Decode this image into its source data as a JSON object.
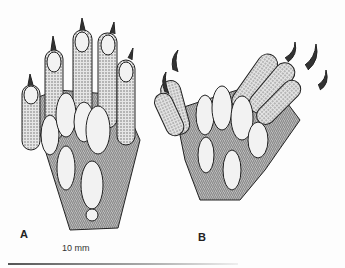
{
  "figure": {
    "panels": [
      {
        "label": "A",
        "description": "paw-left-five-digits"
      },
      {
        "label": "B",
        "description": "paw-right-claws-spread"
      }
    ],
    "scale_text": "10 mm"
  },
  "colors": {
    "ink": "#222222",
    "stipple": "#9a9a9a",
    "pad": "#f2f2f2",
    "background": "#fdfdfd"
  }
}
